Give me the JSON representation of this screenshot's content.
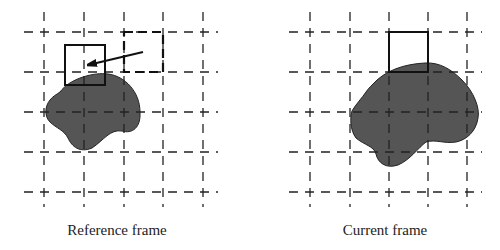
{
  "figure": {
    "panels": [
      {
        "id": "reference",
        "caption": "Reference frame",
        "grid": {
          "x": [
            44,
            84,
            124,
            163,
            203
          ],
          "y": [
            32,
            72,
            112,
            152,
            192
          ],
          "x_extent": [
            24,
            218
          ],
          "y_extent": [
            12,
            207
          ]
        },
        "matched_block": {
          "x": 65,
          "y": 45,
          "w": 40,
          "h": 40
        },
        "co_located_block": {
          "x": 124,
          "y": 32,
          "w": 39,
          "h": 40,
          "style": "bold-dashed"
        },
        "motion_vector": {
          "from": [
            143,
            52
          ],
          "to": [
            85,
            66
          ]
        }
      },
      {
        "id": "current",
        "caption": "Current frame",
        "grid": {
          "x": [
            310,
            350,
            389,
            428,
            467
          ],
          "y": [
            32,
            72,
            112,
            152,
            192
          ],
          "x_extent": [
            289,
            482
          ],
          "y_extent": [
            12,
            207
          ]
        },
        "current_block": {
          "x": 389,
          "y": 32,
          "w": 39,
          "h": 40
        }
      }
    ],
    "colors": {
      "object_fill": "#555555",
      "lines": "#222222",
      "background": "#ffffff"
    }
  }
}
